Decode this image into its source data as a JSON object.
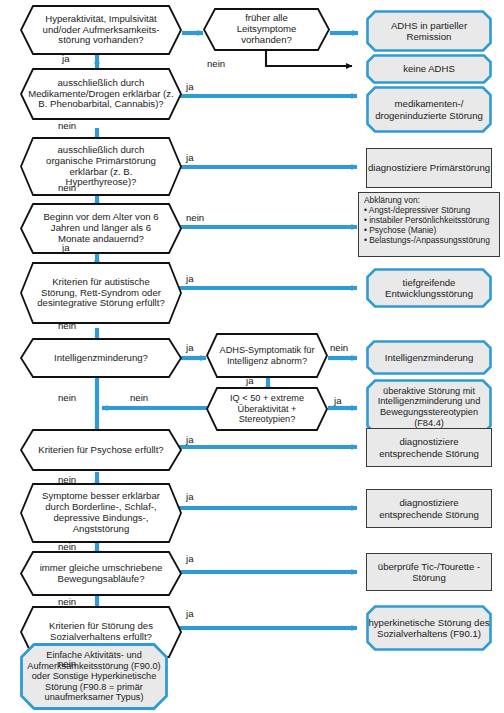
{
  "diagram": {
    "colors": {
      "accent_blue": "#2e9bd6",
      "node_fill": "#e9e9e9",
      "decision_fill": "#ffffff",
      "outline_black": "#111111",
      "outline_grey": "#3a3a3a"
    },
    "decisions": [
      {
        "id": "d1",
        "text": "Hyperaktivität, Impulsivität und/oder Aufmerksamkeits-störung vorhanden?",
        "lines": [
          "Hyperaktivität, Impulsivität",
          "und/oder Aufmerksamkeits-",
          "störung vorhanden?"
        ]
      },
      {
        "id": "d2",
        "text": "früher alle Leitsymptome vorhanden?",
        "lines": [
          "früher alle",
          "Leitsymptome",
          "vorhanden?"
        ]
      },
      {
        "id": "d3",
        "text": "ausschließlich durch Medikamente/Drogen erklärbar (z. B. Phenobarbital, Cannabis)?",
        "lines": [
          "ausschließlich durch",
          "Medikamente/Drogen erklärbar",
          "(z. B. Phenobarbital, Cannabis)?"
        ]
      },
      {
        "id": "d4",
        "text": "ausschließlich durch organische Primärstörung erklärbar (z. B. Hyperthyreose)?",
        "lines": [
          "ausschließlich durch",
          "organische Primärstörung",
          "erklärbar",
          "(z. B. Hyperthyreose)?"
        ]
      },
      {
        "id": "d5",
        "text": "Beginn vor dem Alter von 6 Jahren und länger als 6 Monate andauernd?",
        "lines": [
          "Beginn vor dem Alter",
          "von 6 Jahren und länger",
          "als 6 Monate andauernd?"
        ]
      },
      {
        "id": "d6",
        "text": "Kriterien für autistische Störung, Rett-Syndrom oder desintegrative Störung erfüllt?",
        "lines": [
          "Kriterien für autistische",
          "Störung, Rett-Syndrom",
          "oder desintegrative",
          "Störung erfüllt?"
        ]
      },
      {
        "id": "d7",
        "text": "Intelligenzminderung?",
        "lines": [
          "Intelligenzminderung?"
        ]
      },
      {
        "id": "d8",
        "text": "ADHS-Symptomatik für Intelligenz abnorm?",
        "lines": [
          "ADHS-Symptomatik",
          "für Intelligenz",
          "abnorm?"
        ]
      },
      {
        "id": "d9",
        "text": "IQ < 50 + extreme Überaktivität + Stereotypien?",
        "lines": [
          "IQ < 50 + extreme",
          "Überaktivität +",
          "Stereotypien?"
        ]
      },
      {
        "id": "d10",
        "text": "Kriterien für Psychose erfüllt?",
        "lines": [
          "Kriterien für Psychose",
          "erfüllt?"
        ]
      },
      {
        "id": "d11",
        "text": "Symptome besser erklärbar durch Borderline-, Schlaf-, depressive Bindungs-, Angststörung",
        "lines": [
          "Symptome besser erklärbar",
          "durch Borderline-, Schlaf-,",
          "depressive Bindungs-,",
          "Angststörung"
        ]
      },
      {
        "id": "d12",
        "text": "immer gleiche umschriebene Bewegungsabläufe?",
        "lines": [
          "immer gleiche umschriebene",
          "Bewegungsabläufe?"
        ]
      },
      {
        "id": "d13",
        "text": "Kriterien für Störung des Sozialverhaltens erfüllt?",
        "lines": [
          "Kriterien für Störung",
          "des Sozialverhaltens",
          "erfüllt?"
        ]
      }
    ],
    "outcomes": [
      {
        "id": "o1",
        "shape": "octagon",
        "text": "ADHS in partieller Remission",
        "lines": [
          "ADHS in partieller",
          "Remission"
        ]
      },
      {
        "id": "o2",
        "shape": "octagon",
        "text": "keine ADHS",
        "lines": [
          "keine ADHS"
        ]
      },
      {
        "id": "o3",
        "shape": "octagon",
        "text": "medikamenten-/ drogeninduzierte Störung",
        "lines": [
          "medikamenten-/",
          "drogeninduzierte",
          "Störung"
        ]
      },
      {
        "id": "o4",
        "shape": "rect",
        "text": "diagnostiziere Primärstörung",
        "lines": [
          "diagnostiziere",
          "Primärstörung"
        ]
      },
      {
        "id": "o5",
        "shape": "rect-list",
        "text": "Abklärung von:",
        "heading": "Abklärung von:",
        "items": [
          "• Angst-/depressiver Störung",
          "• instabiler Persönlichkeitsstörung",
          "• Psychose (Manie)",
          "• Belastungs-/Anpassungsstörung"
        ]
      },
      {
        "id": "o6",
        "shape": "octagon",
        "text": "tiefgreifende Entwicklungsstörung",
        "lines": [
          "tiefgreifende",
          "Entwicklungsstörung"
        ]
      },
      {
        "id": "o7",
        "shape": "octagon",
        "text": "Intelligenzminderung",
        "lines": [
          "Intelligenzminderung"
        ]
      },
      {
        "id": "o8",
        "shape": "octagon",
        "text": "überaktive Störung mit Intelligenzminderung und Bewegungsstereotypien (F84.4)",
        "lines": [
          "überaktive Störung mit",
          "Intelligenzminderung und",
          "Bewegungsstereotypien",
          "(F84.4)"
        ]
      },
      {
        "id": "o9",
        "shape": "rect",
        "text": "diagnostiziere entsprechende Störung",
        "lines": [
          "diagnostiziere",
          "entsprechende Störung"
        ]
      },
      {
        "id": "o10",
        "shape": "rect",
        "text": "diagnostiziere entsprechende Störung",
        "lines": [
          "diagnostiziere",
          "entsprechende Störung"
        ]
      },
      {
        "id": "o11",
        "shape": "rect",
        "text": "überprüfe Tic-/Tourette -Störung",
        "lines": [
          "überprüfe Tic-/Tourette",
          "-Störung"
        ]
      },
      {
        "id": "o12",
        "shape": "octagon",
        "text": "hyperkinetische Störung des Sozialverhaltens (F90.1)",
        "lines": [
          "hyperkinetische  Störung",
          "des Sozialverhaltens",
          "(F90.1)"
        ]
      },
      {
        "id": "o13",
        "shape": "octagon",
        "text": "Einfache Aktivitäts- und Aufmerksamkeitsstörung (F90.0) oder Sonstige Hyperkinetische Störung (F90.8 = primär unaufmerksamer Typus)",
        "lines": [
          "Einfache Aktivitäts- und",
          "Aufmerksamkeitsstörung",
          "(F90.0) oder Sonstige",
          "Hyperkinetische Störung",
          "(F90.8 = primär",
          "unaufmerksamer Typus)"
        ]
      }
    ],
    "edge_labels": {
      "ja": "ja",
      "nein": "nein",
      "e1_ja": "ja",
      "e2_nein": "nein",
      "e3_ja": "ja",
      "e3_nein": "nein",
      "e4_ja": "ja",
      "e4_nein": "nein",
      "e5_nein": "nein",
      "e5_ja": "ja",
      "e6_ja": "ja",
      "e6_nein": "nein",
      "e7_ja": "ja",
      "e7_nein": "nein",
      "e8_nein": "nein",
      "e8_ja": "ja",
      "e9_ja": "ja",
      "e9_nein": "nein",
      "e10_ja": "ja",
      "e10_nein": "nein",
      "e11_ja": "ja",
      "e11_nein": "nein",
      "e12_ja": "ja",
      "e12_nein": "nein",
      "e13_ja": "ja",
      "e13_nein": "nein"
    }
  }
}
